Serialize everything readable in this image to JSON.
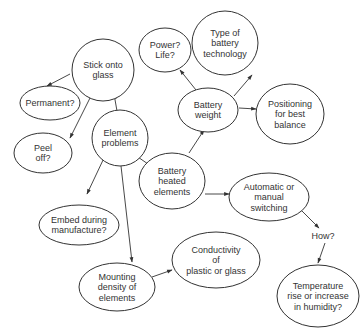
{
  "diagram": {
    "type": "mind-map",
    "colors": {
      "stroke": "#333333",
      "text": "#333333",
      "background": "#ffffff"
    },
    "nodes": [
      {
        "id": "stick",
        "lines": [
          "Stick onto",
          "glass"
        ],
        "cx": 103,
        "cy": 70,
        "rx": 31,
        "ry": 31
      },
      {
        "id": "permanent",
        "lines": [
          "Permanent?"
        ],
        "cx": 50,
        "cy": 103,
        "rx": 30,
        "ry": 17
      },
      {
        "id": "peel",
        "lines": [
          "Peel",
          "off?"
        ],
        "cx": 43,
        "cy": 153,
        "rx": 29,
        "ry": 20
      },
      {
        "id": "element",
        "lines": [
          "Element",
          "problems"
        ],
        "cx": 120,
        "cy": 138,
        "rx": 28,
        "ry": 28
      },
      {
        "id": "power",
        "lines": [
          "Power?",
          "Life?"
        ],
        "cx": 165,
        "cy": 50,
        "rx": 26,
        "ry": 22
      },
      {
        "id": "type",
        "lines": [
          "Type of",
          "battery",
          "technology"
        ],
        "cx": 225,
        "cy": 43,
        "rx": 33,
        "ry": 32
      },
      {
        "id": "weight",
        "lines": [
          "Battery",
          "weight"
        ],
        "cx": 208,
        "cy": 110,
        "rx": 30,
        "ry": 22
      },
      {
        "id": "positioning",
        "lines": [
          "Positioning",
          "for best",
          "balance"
        ],
        "cx": 290,
        "cy": 114,
        "rx": 34,
        "ry": 30
      },
      {
        "id": "heated",
        "lines": [
          "Battery",
          "heated",
          "elements"
        ],
        "cx": 172,
        "cy": 181,
        "rx": 33,
        "ry": 28
      },
      {
        "id": "switching",
        "lines": [
          "Automatic or",
          "manual",
          "switching"
        ],
        "cx": 269,
        "cy": 197,
        "rx": 40,
        "ry": 24
      },
      {
        "id": "embed",
        "lines": [
          "Embed during",
          "manufacture?"
        ],
        "cx": 79,
        "cy": 225,
        "rx": 40,
        "ry": 20
      },
      {
        "id": "mounting",
        "lines": [
          "Mounting",
          "density of",
          "elements"
        ],
        "cx": 117,
        "cy": 287,
        "rx": 38,
        "ry": 24
      },
      {
        "id": "conductivity",
        "lines": [
          "Conductivity",
          "of",
          "plastic or glass"
        ],
        "cx": 216,
        "cy": 260,
        "rx": 44,
        "ry": 28
      },
      {
        "id": "temperature",
        "lines": [
          "Temperature",
          "rise or increase",
          "in humidity?"
        ],
        "cx": 318,
        "cy": 296,
        "rx": 41,
        "ry": 31
      }
    ],
    "labels": [
      {
        "id": "how",
        "text": "How?",
        "x": 323,
        "y": 239
      }
    ],
    "edges": [
      {
        "from": "element",
        "to": "stick",
        "x1": 117,
        "y1": 111,
        "x2": 114,
        "y2": 94
      },
      {
        "from": "stick",
        "to": "permanent",
        "x1": 70,
        "y1": 74,
        "x2": 47,
        "y2": 86
      },
      {
        "from": "stick",
        "to": "peel",
        "x1": 92,
        "y1": 94,
        "x2": 70,
        "y2": 138
      },
      {
        "from": "heated",
        "to": "element",
        "x1": 148,
        "y1": 164,
        "x2": 135,
        "y2": 155
      },
      {
        "from": "element",
        "to": "embed",
        "x1": 104,
        "y1": 158,
        "x2": 87,
        "y2": 194
      },
      {
        "from": "element",
        "to": "mounting",
        "x1": 121,
        "y1": 166,
        "x2": 132,
        "y2": 262
      },
      {
        "from": "heated",
        "to": "weight",
        "x1": 189,
        "y1": 153,
        "x2": 204,
        "y2": 130
      },
      {
        "from": "weight",
        "to": "power",
        "x1": 196,
        "y1": 90,
        "x2": 180,
        "y2": 70
      },
      {
        "from": "type",
        "to": "power",
        "x1": 222,
        "y1": 43,
        "x2": 194,
        "y2": 46
      },
      {
        "from": "weight",
        "to": "type",
        "x1": 234,
        "y1": 96,
        "x2": 252,
        "y2": 75
      },
      {
        "from": "weight",
        "to": "positioning",
        "x1": 239,
        "y1": 108,
        "x2": 256,
        "y2": 109
      },
      {
        "from": "heated",
        "to": "switching",
        "x1": 205,
        "y1": 194,
        "x2": 229,
        "y2": 194
      },
      {
        "from": "switching",
        "to": "how",
        "x1": 301,
        "y1": 210,
        "x2": 319,
        "y2": 228
      },
      {
        "from": "how",
        "to": "temperature",
        "x1": 325,
        "y1": 243,
        "x2": 318,
        "y2": 263
      },
      {
        "from": "mounting",
        "to": "conductivity",
        "x1": 152,
        "y1": 277,
        "x2": 172,
        "y2": 270
      }
    ]
  }
}
